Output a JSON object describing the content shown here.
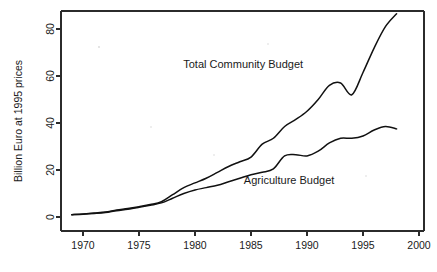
{
  "chart_data": {
    "type": "line",
    "title": "",
    "xlabel": "",
    "ylabel": "Billion Euro at 1995 prices",
    "xlim": [
      1968.0,
      2000.5
    ],
    "ylim": [
      -2,
      92
    ],
    "xticks": [
      1970,
      1975,
      1980,
      1985,
      1990,
      1995,
      2000
    ],
    "xtick_labels": [
      "1970",
      "1975",
      "1980",
      "1985",
      "1990",
      "1995",
      "2000"
    ],
    "yticks": [
      0,
      20,
      40,
      60,
      80
    ],
    "ytick_labels": [
      "0",
      "20",
      "40",
      "60",
      "80"
    ],
    "grid": false,
    "legend": "inline-annotations",
    "x": [
      1969,
      1970,
      1971,
      1972,
      1973,
      1974,
      1975,
      1976,
      1977,
      1978,
      1979,
      1980,
      1981,
      1982,
      1983,
      1984,
      1985,
      1986,
      1987,
      1988,
      1989,
      1990,
      1991,
      1992,
      1993,
      1994,
      1995,
      1996,
      1997,
      1998
    ],
    "series": [
      {
        "name": "Total Community Budget",
        "label": "Total Community Budget",
        "label_x": 1984.3,
        "label_y": 63.5,
        "color": "#111111",
        "values": [
          1.0,
          1.3,
          1.7,
          2.1,
          3.0,
          3.6,
          4.4,
          5.3,
          6.5,
          9.5,
          12.5,
          14.5,
          16.5,
          19.0,
          21.5,
          23.5,
          25.5,
          31.0,
          33.5,
          38.5,
          41.5,
          45.0,
          50.0,
          56.0,
          57.0,
          52.0,
          61.5,
          72.0,
          81.0,
          86.5
        ],
        "units": "Billion Euro at 1995 prices"
      },
      {
        "name": "Agriculture Budget",
        "label": "Agriculture Budget",
        "label_x": 1988.4,
        "label_y": 14.0,
        "color": "#111111",
        "values": [
          1.0,
          1.2,
          1.5,
          1.9,
          2.7,
          3.3,
          4.1,
          5.0,
          6.0,
          8.0,
          10.0,
          11.5,
          12.5,
          13.5,
          15.0,
          16.5,
          18.0,
          19.0,
          20.5,
          26.0,
          26.5,
          26.0,
          28.0,
          31.5,
          33.5,
          33.5,
          34.5,
          37.0,
          38.5,
          37.5
        ],
        "units": "Billion Euro at 1995 prices"
      }
    ]
  }
}
